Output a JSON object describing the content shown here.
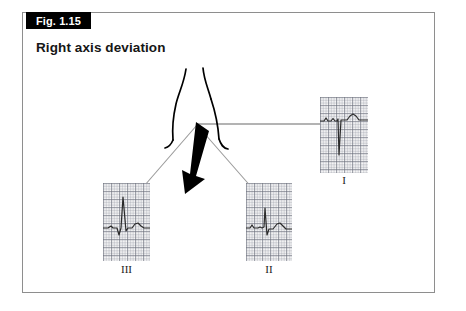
{
  "figure": {
    "number_label": "Fig. 1.15",
    "title": "Right axis deviation"
  },
  "colors": {
    "frame_border": "#8e8e8e",
    "tag_background": "#000000",
    "tag_text": "#ffffff",
    "title_text": "#161616",
    "axis_arrow": "#000000",
    "lead_line": "#9a9a9a",
    "torso_outline": "#000000",
    "ecg_trace": "#2a2a2a",
    "ecg_grid": "#6c707c"
  },
  "diagram": {
    "torso_name": "torso-outline",
    "axis_arrow_name": "mean-electrical-axis-arrow",
    "axis_arrow_direction": "down-left",
    "lead_lines": [
      {
        "name": "lead-line-I",
        "to": "I"
      },
      {
        "name": "lead-line-II",
        "to": "II"
      },
      {
        "name": "lead-line-III",
        "to": "III"
      }
    ]
  },
  "ecg_strips": [
    {
      "id": "I",
      "label": "I",
      "description": "deep negative S wave",
      "deflection": "negative"
    },
    {
      "id": "II",
      "label": "II",
      "description": "small positive R wave with S wave",
      "deflection": "biphasic"
    },
    {
      "id": "III",
      "label": "III",
      "description": "tall positive R wave",
      "deflection": "positive"
    }
  ]
}
